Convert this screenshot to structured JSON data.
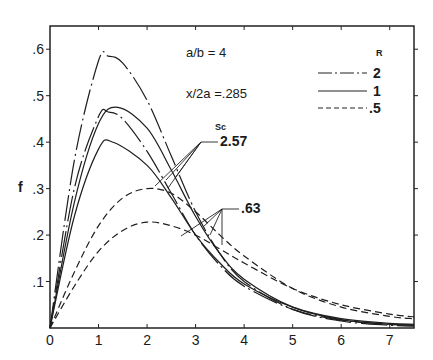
{
  "chart_data": {
    "type": "line",
    "title": "",
    "xlabel": "",
    "ylabel": "f",
    "xlim": [
      0,
      7.5
    ],
    "ylim": [
      0,
      0.65
    ],
    "xticks": [
      "0",
      "1",
      "2",
      "3",
      "4",
      "5",
      "6",
      "7"
    ],
    "yticks": [
      ".1",
      ".2",
      ".3",
      ".4",
      ".5",
      ".6"
    ],
    "xtick_values": [
      0,
      1,
      2,
      3,
      4,
      5,
      6,
      7
    ],
    "ytick_values": [
      0.1,
      0.2,
      0.3,
      0.4,
      0.5,
      0.6
    ],
    "grid": false,
    "annotations": {
      "ratio": "a/b = 4",
      "position": "x/2a =.285",
      "sc_header": "Sc",
      "sc_high": "2.57",
      "sc_low": ".63"
    },
    "legend": {
      "title": "R",
      "placement": "top-right",
      "entries": [
        {
          "label": "2",
          "style": "dash-dot"
        },
        {
          "label": "1",
          "style": "solid"
        },
        {
          "label": ".5",
          "style": "dashed"
        }
      ]
    },
    "series": [
      {
        "name": "R=2, Sc=2.57",
        "style": "dash-dot",
        "peak_x": 1.2,
        "peak_y": 0.585,
        "x": [
          0,
          0.5,
          1,
          1.2,
          1.5,
          2,
          2.5,
          3,
          3.5,
          4,
          5,
          6,
          7,
          7.5
        ],
        "y": [
          0,
          0.36,
          0.575,
          0.585,
          0.57,
          0.49,
          0.37,
          0.25,
          0.16,
          0.1,
          0.04,
          0.015,
          0.006,
          0.004
        ]
      },
      {
        "name": "R=2, Sc=.63",
        "style": "dash-dot",
        "peak_x": 1.2,
        "peak_y": 0.465,
        "x": [
          0,
          0.5,
          1,
          1.2,
          1.5,
          2,
          2.5,
          3,
          3.5,
          4,
          5,
          6,
          7,
          7.5
        ],
        "y": [
          0,
          0.3,
          0.455,
          0.465,
          0.45,
          0.38,
          0.29,
          0.2,
          0.135,
          0.09,
          0.04,
          0.017,
          0.008,
          0.006
        ]
      },
      {
        "name": "R=1, Sc=2.57",
        "style": "solid",
        "peak_x": 1.4,
        "peak_y": 0.475,
        "x": [
          0,
          0.5,
          1,
          1.4,
          2,
          2.5,
          3,
          3.5,
          4,
          5,
          6,
          7,
          7.5
        ],
        "y": [
          0,
          0.27,
          0.44,
          0.475,
          0.43,
          0.34,
          0.24,
          0.16,
          0.105,
          0.045,
          0.018,
          0.008,
          0.006
        ]
      },
      {
        "name": "R=1, Sc=.63",
        "style": "solid",
        "peak_x": 1.3,
        "peak_y": 0.4,
        "x": [
          0,
          0.5,
          1,
          1.3,
          2,
          2.5,
          3,
          3.5,
          4,
          5,
          6,
          7,
          7.5
        ],
        "y": [
          0,
          0.24,
          0.385,
          0.4,
          0.35,
          0.28,
          0.2,
          0.14,
          0.095,
          0.045,
          0.02,
          0.01,
          0.008
        ]
      },
      {
        "name": "R=.5, Sc=2.57",
        "style": "dashed",
        "peak_x": 2.0,
        "peak_y": 0.3,
        "x": [
          0,
          0.5,
          1,
          1.5,
          2,
          2.5,
          3,
          3.5,
          4,
          5,
          6,
          7,
          7.5
        ],
        "y": [
          0,
          0.12,
          0.22,
          0.28,
          0.3,
          0.29,
          0.25,
          0.2,
          0.155,
          0.085,
          0.045,
          0.025,
          0.02
        ]
      },
      {
        "name": "R=.5, Sc=.63",
        "style": "dashed",
        "peak_x": 2.0,
        "peak_y": 0.228,
        "x": [
          0,
          0.5,
          1,
          1.5,
          2,
          2.5,
          3,
          3.5,
          4,
          5,
          6,
          7,
          7.5
        ],
        "y": [
          0,
          0.09,
          0.165,
          0.21,
          0.228,
          0.22,
          0.2,
          0.17,
          0.14,
          0.085,
          0.05,
          0.03,
          0.024
        ]
      }
    ]
  }
}
